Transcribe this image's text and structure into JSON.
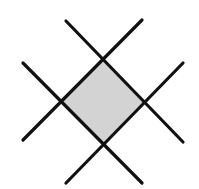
{
  "diagram": {
    "colors": {
      "line": "#111111",
      "fill": "#d3d3d3",
      "background": "#ffffff"
    },
    "lines": [
      {
        "x1": 66,
        "y1": 21,
        "x2": 183,
        "y2": 142
      },
      {
        "x1": 23,
        "y1": 63,
        "x2": 142,
        "y2": 183
      },
      {
        "x1": 142,
        "y1": 20,
        "x2": 23,
        "y2": 140
      },
      {
        "x1": 183,
        "y1": 63,
        "x2": 66,
        "y2": 183
      }
    ],
    "diamond": [
      [
        103,
        60
      ],
      [
        143,
        102
      ],
      [
        103,
        143
      ],
      [
        61,
        101
      ]
    ]
  }
}
